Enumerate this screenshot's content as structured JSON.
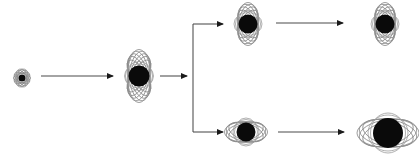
{
  "figure": {
    "background_color": "#ffffff",
    "width": 419,
    "height": 160
  },
  "style": {
    "nucleus_color": "#0a0a0a",
    "orbit_color": "#8c8c8c",
    "arrow_color": "#4a4a4a",
    "arrowhead_color": "#1a1a1a"
  },
  "nodes": [
    {
      "id": "node-seed",
      "label": "seed atom",
      "cx": 22,
      "cy": 78,
      "nucleus_r": 3.6,
      "orbit_orientation": "vertical",
      "orbit_count": 6,
      "orbit_rx": 4.5,
      "orbit_ry": 8.5,
      "scale": "smallest"
    },
    {
      "id": "node-stage2",
      "label": "stage two atom",
      "cx": 139,
      "cy": 76,
      "nucleus_r": 10.5,
      "orbit_orientation": "vertical",
      "orbit_count": 9,
      "orbit_rx": 11,
      "orbit_ry": 26,
      "scale": "medium"
    },
    {
      "id": "node-branch-top",
      "label": "upper branch atom",
      "cx": 248,
      "cy": 24,
      "nucleus_r": 9.5,
      "orbit_orientation": "vertical",
      "orbit_count": 8,
      "orbit_rx": 10,
      "orbit_ry": 21,
      "scale": "medium"
    },
    {
      "id": "node-branch-bottom",
      "label": "lower branch atom",
      "cx": 246,
      "cy": 132,
      "nucleus_r": 9.5,
      "orbit_orientation": "horizontal",
      "orbit_count": 7,
      "orbit_rx": 21,
      "orbit_ry": 10,
      "scale": "medium"
    },
    {
      "id": "node-final-top",
      "label": "upper final atom",
      "cx": 385,
      "cy": 24,
      "nucleus_r": 9.5,
      "orbit_orientation": "vertical",
      "orbit_count": 8,
      "orbit_rx": 10,
      "orbit_ry": 21,
      "scale": "medium"
    },
    {
      "id": "node-final-bottom",
      "label": "lower final atom",
      "cx": 388,
      "cy": 133,
      "nucleus_r": 15,
      "orbit_orientation": "horizontal",
      "orbit_count": 7,
      "orbit_rx": 31,
      "orbit_ry": 14,
      "scale": "largest"
    }
  ],
  "arrows": [
    {
      "id": "arrow-seed-to-stage2",
      "label": "seed to stage two",
      "from": "node-seed",
      "to": "node-stage2",
      "type": "straight-horizontal",
      "x1": 41,
      "y1": 76,
      "x2": 114,
      "y2": 76
    },
    {
      "id": "arrow-stage2-to-branch",
      "label": "stage two to branch point",
      "from": "node-stage2",
      "to": "branch-junction",
      "type": "straight-horizontal",
      "x1": 160,
      "y1": 76,
      "x2": 188,
      "y2": 76
    },
    {
      "id": "arrow-branch-upper",
      "label": "branch to upper atom",
      "from": "branch-junction",
      "to": "node-branch-top",
      "type": "elbow-up",
      "x1": 193,
      "y1": 76,
      "corner_y": 24,
      "x2": 224,
      "y2": 24
    },
    {
      "id": "arrow-branch-lower",
      "label": "branch to lower atom",
      "from": "branch-junction",
      "to": "node-branch-bottom",
      "type": "elbow-down",
      "x1": 193,
      "y1": 76,
      "corner_y": 132,
      "x2": 224,
      "y2": 132
    },
    {
      "id": "arrow-top-to-final",
      "label": "upper branch to upper final atom",
      "from": "node-branch-top",
      "to": "node-final-top",
      "type": "straight-horizontal",
      "x1": 276,
      "y1": 23,
      "x2": 344,
      "y2": 23
    },
    {
      "id": "arrow-bottom-to-final",
      "label": "lower branch to lower final atom",
      "from": "node-branch-bottom",
      "to": "node-final-bottom",
      "type": "straight-horizontal",
      "x1": 278,
      "y1": 132,
      "x2": 345,
      "y2": 132
    }
  ],
  "branch_junction": {
    "id": "branch-junction",
    "label": "branch junction",
    "x": 193,
    "y_top": 24,
    "y_bottom": 132
  }
}
